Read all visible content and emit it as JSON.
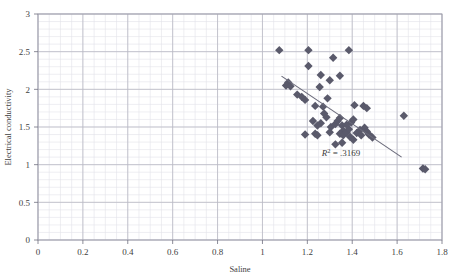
{
  "chart_data": {
    "type": "scatter",
    "title": "",
    "xlabel": "Saline",
    "ylabel": "Electrical conductivity",
    "xlim": [
      0,
      1.8
    ],
    "ylim": [
      0,
      3
    ],
    "x_ticks": [
      "0",
      "0.2",
      "0.4",
      "0.6",
      "0.8",
      "1",
      "1.2",
      "1.4",
      "1.6",
      "1.8"
    ],
    "x_tick_values": [
      0,
      0.2,
      0.4,
      0.6,
      0.8,
      1.0,
      1.2,
      1.4,
      1.6,
      1.8
    ],
    "y_ticks": [
      "0",
      "0.5",
      "1",
      "1.5",
      "2",
      "2.5",
      "3"
    ],
    "y_tick_values": [
      0,
      0.5,
      1.0,
      1.5,
      2.0,
      2.5,
      3.0
    ],
    "grid": {
      "major": true,
      "minor": true,
      "minor_x_step": 0.05,
      "minor_y_step": 0.1,
      "major_color": "#b9b9c4",
      "minor_color": "#e2e2ea"
    },
    "legend": "none",
    "marker": {
      "shape": "diamond",
      "size": 4.2,
      "color": "#5a5a6b"
    },
    "annotations": [
      {
        "name": "r-squared",
        "text_prefix": "R",
        "text_sup": "2",
        "text_suffix": " = .3169",
        "x": 1.35,
        "y": 1.12
      }
    ],
    "trendline": {
      "type": "linear",
      "color": "#6a6a7a",
      "x_start": 1.085,
      "y_start": 2.175,
      "x_end": 1.62,
      "y_end": 1.1,
      "r_squared": 0.3169
    },
    "points": [
      {
        "x": 1.075,
        "y": 2.52
      },
      {
        "x": 1.115,
        "y": 2.09
      },
      {
        "x": 1.105,
        "y": 2.05
      },
      {
        "x": 1.125,
        "y": 2.04
      },
      {
        "x": 1.205,
        "y": 2.52
      },
      {
        "x": 1.205,
        "y": 2.31
      },
      {
        "x": 1.26,
        "y": 2.19
      },
      {
        "x": 1.155,
        "y": 1.93
      },
      {
        "x": 1.175,
        "y": 1.9
      },
      {
        "x": 1.19,
        "y": 1.86
      },
      {
        "x": 1.235,
        "y": 1.78
      },
      {
        "x": 1.27,
        "y": 1.77
      },
      {
        "x": 1.255,
        "y": 2.03
      },
      {
        "x": 1.3,
        "y": 2.12
      },
      {
        "x": 1.345,
        "y": 2.18
      },
      {
        "x": 1.315,
        "y": 2.42
      },
      {
        "x": 1.385,
        "y": 2.52
      },
      {
        "x": 1.275,
        "y": 1.68
      },
      {
        "x": 1.285,
        "y": 1.63
      },
      {
        "x": 1.26,
        "y": 1.55
      },
      {
        "x": 1.245,
        "y": 1.52
      },
      {
        "x": 1.225,
        "y": 1.58
      },
      {
        "x": 1.19,
        "y": 1.4
      },
      {
        "x": 1.235,
        "y": 1.41
      },
      {
        "x": 1.245,
        "y": 1.39
      },
      {
        "x": 1.3,
        "y": 1.43
      },
      {
        "x": 1.305,
        "y": 1.5
      },
      {
        "x": 1.325,
        "y": 1.54
      },
      {
        "x": 1.335,
        "y": 1.58
      },
      {
        "x": 1.345,
        "y": 1.62
      },
      {
        "x": 1.355,
        "y": 1.52
      },
      {
        "x": 1.36,
        "y": 1.45
      },
      {
        "x": 1.345,
        "y": 1.41
      },
      {
        "x": 1.36,
        "y": 1.39
      },
      {
        "x": 1.375,
        "y": 1.43
      },
      {
        "x": 1.385,
        "y": 1.47
      },
      {
        "x": 1.375,
        "y": 1.53
      },
      {
        "x": 1.395,
        "y": 1.56
      },
      {
        "x": 1.405,
        "y": 1.6
      },
      {
        "x": 1.39,
        "y": 1.37
      },
      {
        "x": 1.405,
        "y": 1.33
      },
      {
        "x": 1.355,
        "y": 1.29
      },
      {
        "x": 1.325,
        "y": 1.27
      },
      {
        "x": 1.42,
        "y": 1.42
      },
      {
        "x": 1.435,
        "y": 1.46
      },
      {
        "x": 1.44,
        "y": 1.39
      },
      {
        "x": 1.455,
        "y": 1.49
      },
      {
        "x": 1.465,
        "y": 1.44
      },
      {
        "x": 1.475,
        "y": 1.4
      },
      {
        "x": 1.49,
        "y": 1.36
      },
      {
        "x": 1.45,
        "y": 1.78
      },
      {
        "x": 1.465,
        "y": 1.75
      },
      {
        "x": 1.41,
        "y": 1.79
      },
      {
        "x": 1.63,
        "y": 1.65
      },
      {
        "x": 1.715,
        "y": 0.95
      },
      {
        "x": 1.725,
        "y": 0.94
      },
      {
        "x": 1.29,
        "y": 1.88
      }
    ]
  },
  "axes_geometry": {
    "left": 38,
    "right": 442,
    "top": 14,
    "bottom": 240
  }
}
